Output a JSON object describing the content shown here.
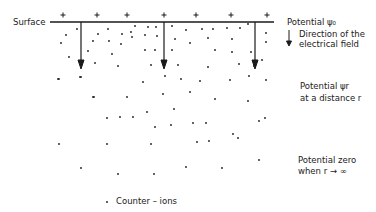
{
  "diagram": {
    "surface_label": "Surface",
    "charge_symbol": "+",
    "labels": {
      "potential_surface": "Potential ψ₀",
      "field_direction_line1": "Direction of the",
      "field_direction_line2": "electrical field",
      "potential_r_line1": "Potential ψr",
      "potential_r_line2": "at a distance r",
      "potential_zero_line1": "Potential zero",
      "potential_zero_line2": "when r → ∞",
      "legend_counter_ions": "Counter – ions"
    },
    "colors": {
      "ink": "#1a1a1a",
      "background": "#ffffff"
    },
    "plus_x": [
      63,
      97,
      127,
      164,
      196,
      231,
      267
    ],
    "arrow_x": [
      81,
      164,
      255
    ],
    "dots": [
      [
        66,
        35
      ],
      [
        77,
        29
      ],
      [
        61,
        43
      ],
      [
        98,
        34
      ],
      [
        93,
        41
      ],
      [
        88,
        51
      ],
      [
        108,
        29
      ],
      [
        109,
        41
      ],
      [
        122,
        34
      ],
      [
        121,
        44
      ],
      [
        112,
        54
      ],
      [
        131,
        32
      ],
      [
        135,
        26
      ],
      [
        132,
        37
      ],
      [
        145,
        35
      ],
      [
        148,
        27
      ],
      [
        156,
        27
      ],
      [
        157,
        36
      ],
      [
        145,
        50
      ],
      [
        151,
        65
      ],
      [
        69,
        57
      ],
      [
        95,
        63
      ],
      [
        118,
        66
      ],
      [
        59,
        79
      ],
      [
        81,
        77
      ],
      [
        143,
        82
      ],
      [
        94,
        97
      ],
      [
        127,
        97
      ],
      [
        172,
        26
      ],
      [
        186,
        30
      ],
      [
        202,
        29
      ],
      [
        213,
        29
      ],
      [
        227,
        28
      ],
      [
        240,
        28
      ],
      [
        248,
        24
      ],
      [
        266,
        33
      ],
      [
        175,
        39
      ],
      [
        190,
        43
      ],
      [
        208,
        38
      ],
      [
        232,
        39
      ],
      [
        266,
        42
      ],
      [
        155,
        50
      ],
      [
        172,
        50
      ],
      [
        215,
        50
      ],
      [
        232,
        52
      ],
      [
        251,
        52
      ],
      [
        262,
        60
      ],
      [
        178,
        65
      ],
      [
        208,
        67
      ],
      [
        239,
        64
      ],
      [
        254,
        66
      ],
      [
        165,
        76
      ],
      [
        181,
        79
      ],
      [
        200,
        81
      ],
      [
        230,
        80
      ],
      [
        249,
        76
      ],
      [
        266,
        80
      ],
      [
        163,
        94
      ],
      [
        190,
        92
      ],
      [
        215,
        99
      ],
      [
        248,
        101
      ],
      [
        58,
        79
      ],
      [
        80,
        77
      ],
      [
        93,
        97
      ],
      [
        107,
        118
      ],
      [
        133,
        117
      ],
      [
        155,
        127
      ],
      [
        174,
        109
      ],
      [
        147,
        112
      ],
      [
        120,
        117
      ],
      [
        171,
        125
      ],
      [
        206,
        123
      ],
      [
        193,
        123
      ],
      [
        209,
        141
      ],
      [
        233,
        134
      ],
      [
        259,
        121
      ],
      [
        265,
        118
      ],
      [
        59,
        144
      ],
      [
        107,
        144
      ],
      [
        151,
        144
      ],
      [
        197,
        142
      ],
      [
        238,
        138
      ],
      [
        81,
        168
      ],
      [
        118,
        174
      ],
      [
        154,
        174
      ],
      [
        186,
        167
      ],
      [
        222,
        168
      ],
      [
        259,
        160
      ]
    ]
  }
}
